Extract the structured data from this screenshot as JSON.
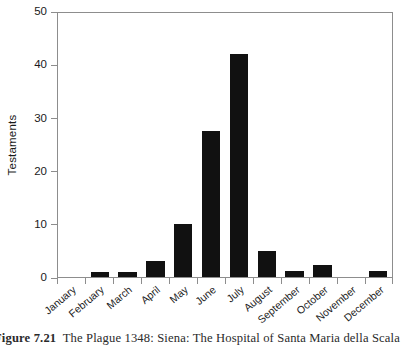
{
  "chart_data": {
    "type": "bar",
    "title": "",
    "xlabel": "",
    "ylabel": "Testaments",
    "categories": [
      "January",
      "February",
      "March",
      "April",
      "May",
      "June",
      "July",
      "August",
      "September",
      "October",
      "November",
      "December"
    ],
    "values": [
      0,
      1,
      1,
      3,
      10,
      27.5,
      42,
      4.8,
      1.2,
      2.2,
      0,
      1.2
    ],
    "ylim": [
      0,
      50
    ],
    "yticks": [
      0,
      10,
      20,
      30,
      40,
      50
    ],
    "ytick_labels": [
      "0",
      "10",
      "20",
      "30",
      "40",
      "50"
    ],
    "grid": false,
    "legend": null,
    "bar_color": "#111111",
    "axis_color": "#8d8d8d",
    "background_color": "#ffffff"
  },
  "caption": {
    "figure_number": "Figure 7.21",
    "text": "The Plague 1348: Siena: The Hospital of Santa Maria della Scala"
  }
}
